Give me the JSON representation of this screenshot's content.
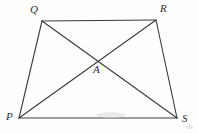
{
  "figure": {
    "type": "geometry-diagram",
    "shape": "trapezoid-with-diagonals",
    "background_color": "#fefefe",
    "stroke_color": "#3a3a3a",
    "label_color": "#2e2e2e",
    "stroke_width": 1,
    "canvas": {
      "width": 198,
      "height": 133
    },
    "vertices": [
      {
        "name": "P",
        "label": "P",
        "x": 19,
        "y": 118,
        "label_x": 6,
        "label_y": 111
      },
      {
        "name": "Q",
        "label": "Q",
        "x": 42,
        "y": 21,
        "label_x": 30,
        "label_y": 4
      },
      {
        "name": "R",
        "label": "R",
        "x": 156,
        "y": 20,
        "label_x": 160,
        "label_y": 3
      },
      {
        "name": "S",
        "label": "S",
        "x": 177,
        "y": 118,
        "label_x": 182,
        "label_y": 113
      },
      {
        "name": "A",
        "label": "A",
        "x": 99,
        "y": 61,
        "label_x": 93,
        "label_y": 64
      }
    ],
    "segments": [
      {
        "name": "side-QR",
        "from": "Q",
        "to": "R"
      },
      {
        "name": "side-RS",
        "from": "R",
        "to": "S"
      },
      {
        "name": "side-SP",
        "from": "S",
        "to": "P"
      },
      {
        "name": "side-PQ",
        "from": "P",
        "to": "Q"
      },
      {
        "name": "diagonal-PR",
        "from": "P",
        "to": "R"
      },
      {
        "name": "diagonal-QS",
        "from": "Q",
        "to": "S"
      }
    ]
  }
}
